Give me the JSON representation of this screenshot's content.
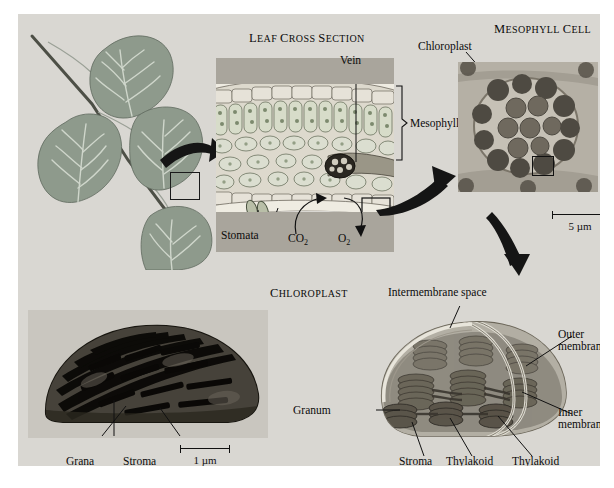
{
  "figure": {
    "background": "#d9d7d2",
    "panels": {
      "leaf_plant": {
        "name": "leaf twig illustration"
      },
      "leaf_cross_section": {
        "heading": "Leaf cross section",
        "labels": {
          "vein": "Vein",
          "mesophyll": "Mesophyll",
          "stomata": "Stomata",
          "co2": "CO",
          "co2_sub": "2",
          "o2": "O",
          "o2_sub": "2"
        }
      },
      "mesophyll_cell": {
        "heading": "Mesophyll cell",
        "labels": {
          "chloroplast": "Chloroplast"
        },
        "scale": "5 µm"
      },
      "chloroplast_tem": {
        "labels": {
          "grana": "Grana",
          "stroma": "Stroma"
        },
        "scale": "1 µm"
      },
      "chloroplast_3d": {
        "heading": "Chloroplast",
        "labels": {
          "intermembrane_space": "Intermembrane space",
          "outer_membrane_line1": "Outer",
          "outer_membrane_line2": "membrane",
          "inner_membrane_line1": "Inner",
          "inner_membrane_line2": "membrane",
          "granum": "Granum",
          "stroma": "Stroma",
          "thylakoid": "Thylakoid",
          "thylakoid_compartment_line1": "Thylakoid",
          "thylakoid_compartment_line2": "compartment"
        }
      }
    }
  }
}
